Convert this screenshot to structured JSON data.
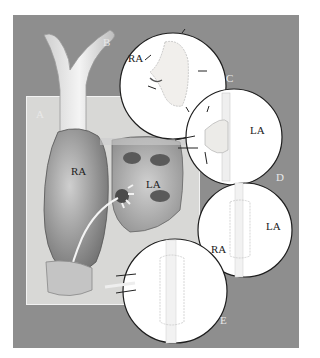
{
  "figure": {
    "panel_labels": {
      "A": "A",
      "B": "B",
      "C": "C",
      "D": "D",
      "E": "E"
    },
    "main_heart": {
      "right_atrium": "RA",
      "left_atrium": "LA"
    },
    "inset_C": {
      "label": "RA"
    },
    "inset_D": {
      "label": "LA"
    },
    "inset_RA_LA": {
      "left": "RA",
      "right": "LA"
    }
  },
  "colors": {
    "frame": "#8e8e8e",
    "panel": "#d8d8d6",
    "inset_bg": "#ffffff",
    "outline": "#222222"
  }
}
